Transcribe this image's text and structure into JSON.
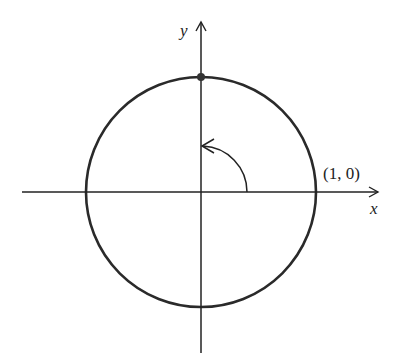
{
  "diagram": {
    "type": "unit-circle",
    "axes": {
      "x_label": "x",
      "y_label": "y"
    },
    "point_label": "(1, 0)",
    "marked_point": "(0, 1)",
    "rotation": "counterclockwise quarter turn from (1, 0) toward positive y-axis",
    "colors": {
      "stroke": "#222222",
      "background": "#ffffff"
    }
  }
}
